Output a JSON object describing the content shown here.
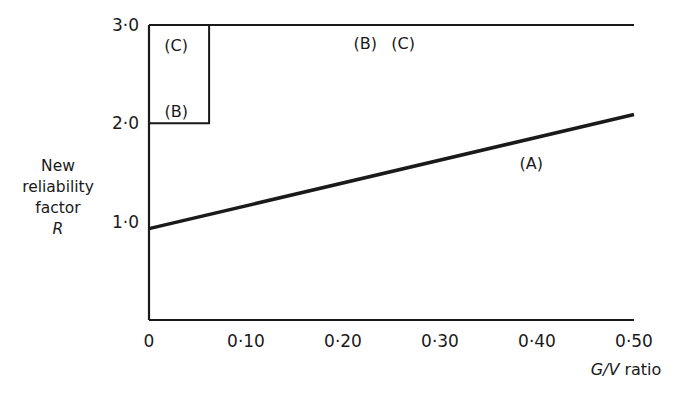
{
  "chart_data": {
    "type": "line",
    "title": "",
    "xlabel_italic": "G/V",
    "xlabel_suffix": "ratio",
    "xlabel": "G/V ratio",
    "ylabel_lines": [
      "New",
      "reliability",
      "factor",
      "R"
    ],
    "ylabel": "New reliability factor R",
    "xlim": [
      0,
      0.5
    ],
    "ylim": [
      0,
      3.0
    ],
    "x_ticks": [
      {
        "value": 0,
        "label": "0"
      },
      {
        "value": 0.1,
        "label": "0·10"
      },
      {
        "value": 0.2,
        "label": "0·20"
      },
      {
        "value": 0.3,
        "label": "0·30"
      },
      {
        "value": 0.4,
        "label": "0·40"
      },
      {
        "value": 0.5,
        "label": "0·50"
      }
    ],
    "y_ticks": [
      {
        "value": 1.0,
        "label": "1·0"
      },
      {
        "value": 2.0,
        "label": "2·0"
      },
      {
        "value": 3.0,
        "label": "3·0"
      }
    ],
    "grid": false,
    "series": [
      {
        "name": "(A)",
        "x": [
          0,
          0.5
        ],
        "y": [
          0.93,
          2.09
        ],
        "stroke_width": 3.5
      },
      {
        "name": "(B)",
        "x": [
          0,
          0.062,
          0.062,
          0.5
        ],
        "y": [
          2.0,
          2.0,
          3.0,
          3.0
        ],
        "stroke_width": 2
      },
      {
        "name": "(C)",
        "x": [
          0,
          0.5
        ],
        "y": [
          3.0,
          3.0
        ],
        "stroke_width": 2
      }
    ],
    "annotations": [
      {
        "text": "(C)",
        "x": 0.028,
        "y": 2.8
      },
      {
        "text": "(B)",
        "x": 0.028,
        "y": 2.13
      },
      {
        "text": "(B)",
        "x": 0.223,
        "y": 2.82
      },
      {
        "text": "(C)",
        "x": 0.262,
        "y": 2.82
      },
      {
        "text": "(A)",
        "x": 0.394,
        "y": 1.6
      }
    ]
  }
}
